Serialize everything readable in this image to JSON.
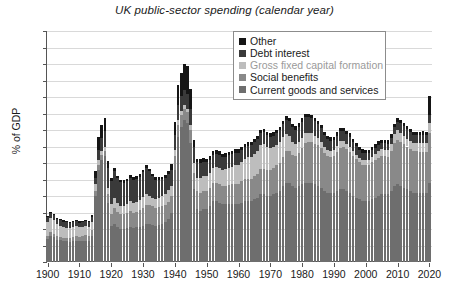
{
  "chart_data": {
    "type": "bar",
    "stacked": true,
    "title": "UK public-sector spending (calendar year)",
    "xlabel": "",
    "ylabel": "% of GDP",
    "ylim": [
      0,
      70
    ],
    "ytick_step": 5,
    "yticks": [
      0,
      5,
      10,
      15,
      20,
      25,
      30,
      35,
      40,
      45,
      50,
      55,
      60,
      65,
      70
    ],
    "xticks": [
      1900,
      1910,
      1920,
      1930,
      1940,
      1950,
      1960,
      1970,
      1980,
      1990,
      2000,
      2010,
      2020
    ],
    "xlim": [
      1900,
      2020
    ],
    "grid": "horizontal",
    "legend_position": "top-right",
    "series": [
      {
        "name": "Current goods and services",
        "color": "#6e6e6e",
        "values": [
          7.0,
          8.0,
          7.6,
          6.8,
          6.6,
          6.4,
          6.3,
          6.2,
          6.4,
          6.5,
          6.3,
          6.4,
          6.5,
          6.3,
          8.0,
          20.0,
          28.0,
          31.0,
          32.0,
          18.0,
          11.0,
          11.5,
          10.5,
          10.0,
          10.0,
          10.2,
          10.6,
          10.4,
          10.5,
          10.7,
          11.0,
          11.6,
          11.4,
          11.2,
          11.0,
          11.2,
          11.6,
          12.2,
          13.0,
          15.0,
          28.0,
          38.0,
          41.0,
          43.0,
          42.0,
          36.0,
          22.0,
          16.0,
          15.5,
          16.0,
          16.0,
          17.0,
          18.5,
          18.5,
          18.0,
          17.5,
          17.5,
          17.5,
          17.5,
          17.5,
          17.5,
          18.0,
          18.5,
          18.5,
          18.5,
          19.0,
          19.5,
          20.5,
          20.5,
          20.0,
          20.0,
          20.5,
          21.0,
          21.5,
          23.0,
          24.0,
          24.0,
          23.0,
          22.5,
          23.0,
          23.5,
          24.0,
          24.0,
          24.0,
          23.5,
          23.0,
          22.5,
          21.5,
          21.0,
          21.0,
          21.0,
          21.5,
          22.0,
          22.0,
          21.5,
          21.0,
          20.0,
          19.5,
          19.0,
          18.5,
          18.5,
          18.5,
          19.0,
          19.5,
          20.0,
          20.5,
          20.5,
          20.5,
          21.5,
          23.0,
          23.5,
          23.0,
          22.5,
          22.0,
          21.5,
          21.0,
          21.0,
          21.0,
          21.0,
          21.0,
          24.0
        ]
      },
      {
        "name": "Social benefits",
        "color": "#898989",
        "values": [
          1.0,
          1.0,
          1.0,
          1.0,
          1.0,
          1.0,
          1.1,
          1.1,
          1.2,
          1.3,
          1.4,
          1.5,
          1.6,
          1.6,
          1.6,
          1.5,
          1.4,
          1.4,
          1.5,
          2.5,
          3.5,
          5.0,
          4.8,
          4.5,
          4.4,
          4.5,
          4.8,
          4.6,
          4.7,
          5.0,
          5.5,
          5.8,
          5.8,
          5.7,
          5.5,
          5.4,
          5.3,
          5.2,
          5.3,
          5.0,
          4.0,
          3.5,
          3.5,
          3.5,
          3.5,
          4.0,
          5.0,
          5.5,
          5.5,
          5.5,
          5.5,
          5.5,
          5.5,
          5.5,
          5.5,
          5.5,
          5.6,
          5.8,
          6.0,
          6.2,
          6.2,
          6.4,
          6.6,
          6.8,
          6.8,
          7.0,
          7.2,
          7.6,
          7.8,
          7.8,
          7.8,
          8.0,
          8.4,
          8.4,
          8.8,
          9.5,
          9.5,
          9.4,
          9.6,
          10.0,
          11.0,
          12.0,
          12.4,
          12.5,
          12.4,
          12.4,
          12.0,
          11.5,
          11.0,
          10.8,
          11.0,
          11.8,
          12.6,
          12.8,
          12.6,
          12.4,
          12.0,
          11.6,
          11.2,
          11.0,
          11.0,
          11.0,
          11.2,
          11.4,
          11.6,
          11.6,
          11.5,
          11.4,
          12.0,
          13.2,
          13.6,
          13.4,
          13.2,
          13.0,
          12.8,
          12.6,
          12.5,
          12.4,
          12.4,
          12.4,
          15.0
        ]
      },
      {
        "name": "Gross fixed capital formation",
        "color": "#bdbdbd",
        "values": [
          4.0,
          4.2,
          4.0,
          3.6,
          3.4,
          3.2,
          3.0,
          3.0,
          3.0,
          3.0,
          2.8,
          2.8,
          2.8,
          2.8,
          2.6,
          2.0,
          1.5,
          1.2,
          1.2,
          2.0,
          3.0,
          3.0,
          2.6,
          2.4,
          2.6,
          2.8,
          3.0,
          3.0,
          3.0,
          3.0,
          3.2,
          3.2,
          2.8,
          2.6,
          2.6,
          2.8,
          3.0,
          3.2,
          3.4,
          3.0,
          2.0,
          1.5,
          1.2,
          1.0,
          1.0,
          1.5,
          3.0,
          4.0,
          4.5,
          4.5,
          4.5,
          4.5,
          4.5,
          4.8,
          5.0,
          5.0,
          5.0,
          5.2,
          5.4,
          5.6,
          5.8,
          6.0,
          6.2,
          6.4,
          6.6,
          6.8,
          7.0,
          7.4,
          7.4,
          7.0,
          6.6,
          6.4,
          6.2,
          6.4,
          6.2,
          5.4,
          4.8,
          4.0,
          3.6,
          3.4,
          3.2,
          3.0,
          2.8,
          2.6,
          2.4,
          2.2,
          2.0,
          1.8,
          1.8,
          1.8,
          2.0,
          2.0,
          2.0,
          1.8,
          1.6,
          1.6,
          1.5,
          1.4,
          1.4,
          1.4,
          1.4,
          1.5,
          1.6,
          1.8,
          2.0,
          2.0,
          2.0,
          2.0,
          2.2,
          2.6,
          2.8,
          2.6,
          2.4,
          2.4,
          2.4,
          2.4,
          2.5,
          2.6,
          2.8,
          2.8,
          3.0
        ]
      },
      {
        "name": "Debt interest",
        "color": "#3a3a3a",
        "values": [
          1.6,
          1.6,
          1.6,
          1.6,
          1.6,
          1.6,
          1.6,
          1.5,
          1.5,
          1.5,
          1.4,
          1.4,
          1.4,
          1.4,
          1.5,
          2.0,
          3.0,
          4.0,
          5.0,
          6.0,
          7.0,
          8.0,
          7.5,
          7.2,
          7.0,
          7.0,
          7.2,
          7.0,
          7.0,
          7.2,
          7.5,
          8.0,
          7.5,
          6.5,
          5.8,
          5.5,
          5.2,
          5.0,
          5.0,
          4.8,
          4.5,
          4.5,
          4.5,
          4.5,
          4.5,
          4.8,
          5.0,
          4.8,
          4.6,
          4.4,
          4.2,
          4.0,
          4.0,
          4.0,
          4.0,
          3.8,
          3.8,
          3.8,
          3.8,
          3.8,
          3.6,
          3.6,
          3.6,
          3.6,
          3.6,
          3.6,
          3.6,
          3.6,
          3.6,
          3.6,
          3.6,
          3.4,
          3.4,
          3.6,
          3.8,
          4.2,
          4.4,
          4.4,
          4.4,
          4.6,
          4.8,
          5.0,
          4.8,
          4.6,
          4.4,
          4.2,
          4.0,
          3.6,
          3.4,
          3.2,
          3.0,
          3.0,
          3.0,
          3.0,
          3.0,
          3.0,
          2.8,
          2.6,
          2.4,
          2.2,
          2.0,
          2.0,
          2.0,
          2.0,
          2.0,
          2.0,
          2.0,
          2.0,
          2.0,
          2.0,
          2.6,
          3.0,
          3.0,
          2.8,
          2.6,
          2.4,
          2.4,
          2.4,
          2.4,
          2.2,
          2.4
        ]
      },
      {
        "name": "Other",
        "color": "#151515",
        "values": [
          0.4,
          0.4,
          0.4,
          0.4,
          0.4,
          0.4,
          0.4,
          0.4,
          0.4,
          0.4,
          0.4,
          0.4,
          0.4,
          0.4,
          0.5,
          2.0,
          4.0,
          4.0,
          4.0,
          2.0,
          1.0,
          1.0,
          0.8,
          0.8,
          0.8,
          0.8,
          0.8,
          0.8,
          0.8,
          0.8,
          0.8,
          0.8,
          0.8,
          0.8,
          0.8,
          0.8,
          0.8,
          0.8,
          0.8,
          2.0,
          4.0,
          6.0,
          7.0,
          8.0,
          8.5,
          6.0,
          2.0,
          1.0,
          1.0,
          1.0,
          1.0,
          1.0,
          1.0,
          1.0,
          1.0,
          1.0,
          1.0,
          1.0,
          1.0,
          1.0,
          1.0,
          1.0,
          1.0,
          1.0,
          1.0,
          1.0,
          1.0,
          1.0,
          1.0,
          1.0,
          1.0,
          1.0,
          1.0,
          1.0,
          1.0,
          1.0,
          1.0,
          1.0,
          1.0,
          1.0,
          1.0,
          1.0,
          1.0,
          1.0,
          1.0,
          1.0,
          1.0,
          1.0,
          1.0,
          1.0,
          1.0,
          1.0,
          1.0,
          1.0,
          1.0,
          1.0,
          1.0,
          1.0,
          1.0,
          1.0,
          1.0,
          1.0,
          1.0,
          1.0,
          1.0,
          1.0,
          1.0,
          1.0,
          1.0,
          1.0,
          1.0,
          1.0,
          1.0,
          1.0,
          1.0,
          1.0,
          1.0,
          1.0,
          1.0,
          1.0,
          6.0
        ]
      }
    ],
    "years": [
      1900,
      1901,
      1902,
      1903,
      1904,
      1905,
      1906,
      1907,
      1908,
      1909,
      1910,
      1911,
      1912,
      1913,
      1914,
      1915,
      1916,
      1917,
      1918,
      1919,
      1920,
      1921,
      1922,
      1923,
      1924,
      1925,
      1926,
      1927,
      1928,
      1929,
      1930,
      1931,
      1932,
      1933,
      1934,
      1935,
      1936,
      1937,
      1938,
      1939,
      1940,
      1941,
      1942,
      1943,
      1944,
      1945,
      1946,
      1947,
      1948,
      1949,
      1950,
      1951,
      1952,
      1953,
      1954,
      1955,
      1956,
      1957,
      1958,
      1959,
      1960,
      1961,
      1962,
      1963,
      1964,
      1965,
      1966,
      1967,
      1968,
      1969,
      1970,
      1971,
      1972,
      1973,
      1974,
      1975,
      1976,
      1977,
      1978,
      1979,
      1980,
      1981,
      1982,
      1983,
      1984,
      1985,
      1986,
      1987,
      1988,
      1989,
      1990,
      1991,
      1992,
      1993,
      1994,
      1995,
      1996,
      1997,
      1998,
      1999,
      2000,
      2001,
      2002,
      2003,
      2004,
      2005,
      2006,
      2007,
      2008,
      2009,
      2010,
      2011,
      2012,
      2013,
      2014,
      2015,
      2016,
      2017,
      2018,
      2019,
      2020
    ]
  },
  "legend": {
    "items": [
      {
        "label": "Other",
        "color": "#151515",
        "muted": false
      },
      {
        "label": "Debt interest",
        "color": "#3a3a3a",
        "muted": false
      },
      {
        "label": "Gross fixed capital formation",
        "color": "#bdbdbd",
        "muted": true
      },
      {
        "label": "Social benefits",
        "color": "#898989",
        "muted": false
      },
      {
        "label": "Current goods and services",
        "color": "#6e6e6e",
        "muted": false
      }
    ]
  },
  "axes": {
    "y_title": "% of GDP",
    "y_tick_labels": [
      "70",
      "65",
      "60",
      "55",
      "50",
      "45",
      "40",
      "35",
      "30",
      "25",
      "20",
      "15",
      "10",
      "5",
      "0"
    ],
    "x_tick_labels": [
      "1900",
      "1910",
      "1920",
      "1930",
      "1940",
      "1950",
      "1960",
      "1970",
      "1980",
      "1990",
      "2000",
      "2010",
      "2020"
    ]
  },
  "colors": {
    "grid": "#d9d9d9",
    "axis": "#555555",
    "text": "#1a1a1a",
    "legend_border": "#8c8c8c",
    "background": "#ffffff"
  }
}
